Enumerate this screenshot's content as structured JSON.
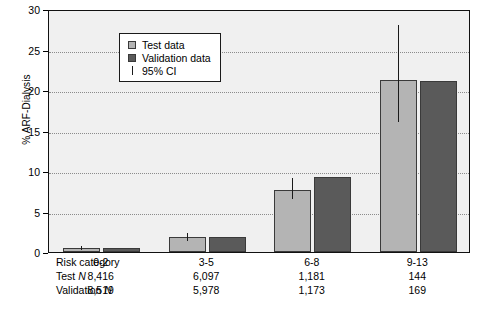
{
  "chart_data": {
    "type": "bar",
    "title": "",
    "xlabel": "",
    "ylabel": "% ARF-Dialysis",
    "ylim": [
      0,
      30
    ],
    "yticks": [
      0,
      5,
      10,
      15,
      20,
      25,
      30
    ],
    "ytick_labels": [
      "0",
      "5",
      "10",
      "15",
      "20",
      "25",
      "30"
    ],
    "grid": "horizontal-dotted",
    "legend_position": "upper-left-inside",
    "categories": [
      "0-2",
      "3-5",
      "6-8",
      "9-13"
    ],
    "series": [
      {
        "name": "Test data",
        "color": "#b4b4b4",
        "values": [
          0.5,
          1.8,
          7.7,
          21.2
        ],
        "ci_low": [
          0.3,
          1.4,
          6.6,
          16.0
        ],
        "ci_high": [
          0.8,
          2.4,
          9.2,
          28.0
        ]
      },
      {
        "name": "Validation data",
        "color": "#5a5a5a",
        "values": [
          0.5,
          1.8,
          9.3,
          21.1
        ],
        "ci_low": [
          null,
          null,
          null,
          null
        ],
        "ci_high": [
          null,
          null,
          null,
          null
        ]
      }
    ],
    "error_bar_label": "95% CI"
  },
  "legend": {
    "items": [
      {
        "label": "Test data",
        "swatch": "light-gray-square",
        "color": "#b4b4b4"
      },
      {
        "label": "Validation data",
        "swatch": "dark-gray-square",
        "color": "#5a5a5a"
      },
      {
        "label": "95% CI",
        "swatch": "vertical-line",
        "color": "#1a1a1a"
      }
    ]
  },
  "axis": {
    "y_title": "% ARF-Dialysis",
    "y_ticks": [
      "30",
      "25",
      "20",
      "15",
      "10",
      "5",
      "0"
    ]
  },
  "table": {
    "rows": [
      {
        "label": "Risk category",
        "label_plain": "Risk category",
        "values": [
          "0-2",
          "3-5",
          "6-8",
          "9-13"
        ]
      },
      {
        "label": "Test N",
        "label_prefix": "Test ",
        "label_italic": "N",
        "values": [
          "8,416",
          "6,097",
          "1,181",
          "144"
        ]
      },
      {
        "label": "Validation N",
        "label_prefix": "Validation ",
        "label_italic": "N",
        "values": [
          "8,519",
          "5,978",
          "1,173",
          "169"
        ]
      }
    ]
  },
  "colors": {
    "test_bar": "#b4b4b4",
    "validation_bar": "#5a5a5a",
    "plot_background": "#f0f0f0",
    "frame": "#111111",
    "gridline": "#8b8b8b",
    "ci_line": "#1a1a1a"
  }
}
